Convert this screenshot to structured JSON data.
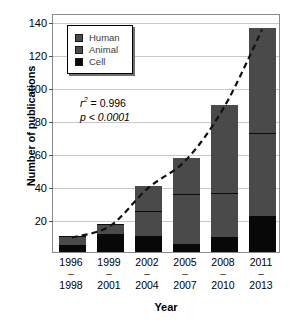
{
  "chart_data": {
    "type": "bar",
    "stacked": true,
    "title": "",
    "xlabel": "Year",
    "ylabel": "Number of publications",
    "categories": [
      "1996–1998",
      "1999–2001",
      "2002–2004",
      "2005–2007",
      "2008–2010",
      "2011–2013"
    ],
    "category_lines": [
      {
        "top": "1996",
        "dash": "–",
        "bottom": "1998"
      },
      {
        "top": "1999",
        "dash": "–",
        "bottom": "2001"
      },
      {
        "top": "2002",
        "dash": "–",
        "bottom": "2004"
      },
      {
        "top": "2005",
        "dash": "–",
        "bottom": "2007"
      },
      {
        "top": "2008",
        "dash": "–",
        "bottom": "2010"
      },
      {
        "top": "2011",
        "dash": "–",
        "bottom": "2013"
      }
    ],
    "series": [
      {
        "name": "Cell",
        "color": "#080808",
        "values": [
          4,
          11,
          10,
          5,
          9,
          22
        ]
      },
      {
        "name": "Animal",
        "color": "#4a4a4a",
        "values": [
          6,
          6,
          15,
          30,
          27,
          50
        ]
      },
      {
        "name": "Human",
        "color": "#4a4a4a",
        "values": [
          0,
          0,
          15,
          22,
          53,
          64
        ]
      }
    ],
    "totals": [
      10,
      17,
      40,
      57,
      89,
      136
    ],
    "ylim": [
      0,
      145
    ],
    "yticks": [
      20,
      40,
      60,
      80,
      100,
      120,
      140
    ],
    "ytick_labels": [
      "20",
      "40",
      "60",
      "80",
      "100",
      "120",
      "140"
    ],
    "grid": true,
    "legend_position": "top-left",
    "trendline": {
      "style": "dashed",
      "color": "#111111",
      "description": "exponential fit through stacked totals"
    },
    "annotations": {
      "r_squared_prefix": "r",
      "r_squared_sup": "2",
      "r_squared_value": " = 0.996",
      "p_value": "p < 0.0001"
    }
  },
  "legend": {
    "items": [
      {
        "label": "Human",
        "color": "#4a4a4a"
      },
      {
        "label": "Animal",
        "color": "#4a4a4a"
      },
      {
        "label": "Cell",
        "color": "#080808"
      }
    ]
  }
}
